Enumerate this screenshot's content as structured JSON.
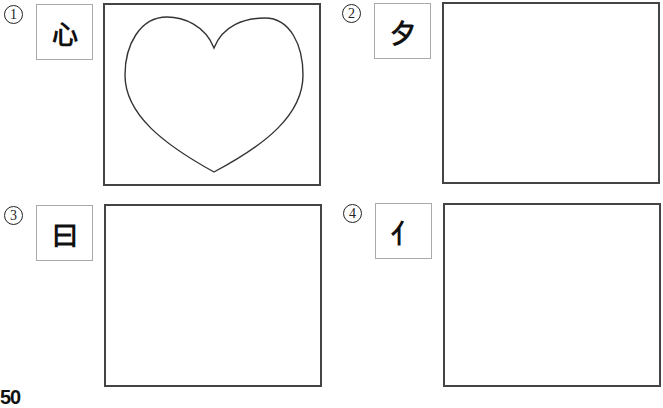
{
  "exercises": [
    {
      "number": "①",
      "character": "心",
      "has_heart_outline": true
    },
    {
      "number": "②",
      "character": "夕",
      "has_heart_outline": false
    },
    {
      "number": "③",
      "character": "曰",
      "has_heart_outline": false
    },
    {
      "number": "④",
      "character": "亻",
      "has_heart_outline": false
    }
  ],
  "page_number": "50",
  "colors": {
    "border": "#444444",
    "char_box_border": "#aaaaaa"
  }
}
